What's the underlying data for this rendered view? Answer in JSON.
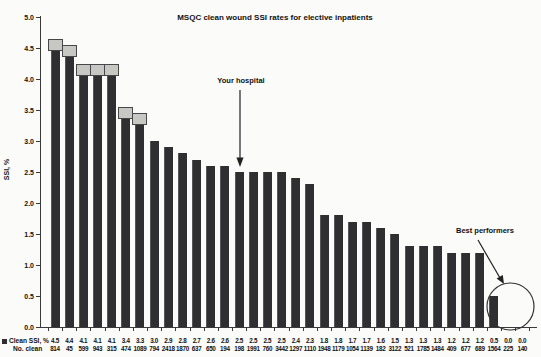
{
  "title": "MSQC clean wound SSI rates for elective inpatients",
  "ylabel": "SSI, %",
  "annotations": {
    "your_hospital": "Your hospital",
    "best_performers": "Best performers"
  },
  "legend": {
    "ssi_label": "Clean SSI, %",
    "n_label": "No. clean"
  },
  "colors": {
    "bar": "#2f2f31",
    "cap_fill": "#c7c7c3",
    "cap_border": "#47474a",
    "axis": "#3a3a3a"
  },
  "chart_data": {
    "type": "bar",
    "title": "MSQC clean wound SSI rates for elective inpatients",
    "xlabel": "",
    "ylabel": "SSI, %",
    "ylim": [
      0.0,
      5.0
    ],
    "ytick_step": 0.5,
    "grid": false,
    "legend_position": "bottom-left",
    "series": [
      {
        "name": "Clean SSI, %",
        "values": [
          4.5,
          4.4,
          4.1,
          4.1,
          4.1,
          3.4,
          3.3,
          3.0,
          2.9,
          2.8,
          2.7,
          2.6,
          2.6,
          2.5,
          2.5,
          2.5,
          2.5,
          2.4,
          2.3,
          1.8,
          1.8,
          1.7,
          1.7,
          1.6,
          1.5,
          1.3,
          1.3,
          1.3,
          1.2,
          1.2,
          1.2,
          0.5,
          0.0,
          0.0
        ]
      },
      {
        "name": "No. clean",
        "values": [
          814,
          45,
          599,
          943,
          315,
          474,
          1089,
          794,
          2418,
          1870,
          637,
          650,
          194,
          198,
          1991,
          760,
          3442,
          1297,
          1110,
          1948,
          1179,
          1054,
          1139,
          182,
          3122,
          521,
          1785,
          1484,
          409,
          677,
          689,
          1564,
          225,
          140
        ]
      }
    ],
    "capped_bar_indices": [
      0,
      1,
      2,
      3,
      4,
      5,
      6
    ],
    "your_hospital_index": 13,
    "best_performers_indices": [
      31,
      32,
      33
    ]
  }
}
